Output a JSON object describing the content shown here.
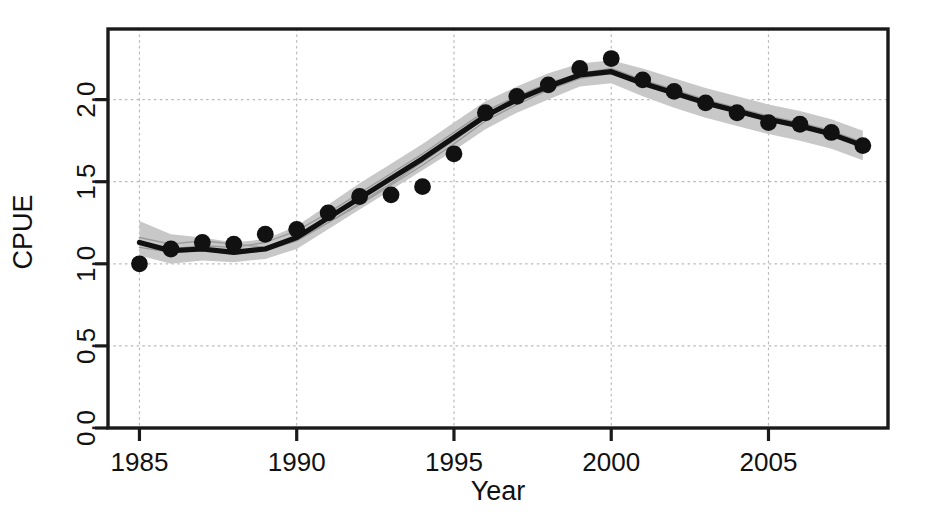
{
  "figure": {
    "background": "#ffffff",
    "frame_color": "#1a1a1a",
    "grid_color": "#b9b9b9",
    "point_color": "#111111",
    "line_color": "#111111",
    "band_color": "#c8c8c8",
    "replicate_color": "#9a9a9a"
  },
  "axes": {
    "x_title": "Year",
    "y_title": "CPUE",
    "x_ticks": [
      "1985",
      "1990",
      "1995",
      "2000",
      "2005"
    ],
    "y_ticks": [
      "0.0",
      "0.5",
      "1.0",
      "1.5",
      "2.0"
    ]
  },
  "chart_data": {
    "type": "line",
    "title": "",
    "xlabel": "Year",
    "ylabel": "CPUE",
    "xlim": [
      1984.0,
      2008.8
    ],
    "ylim": [
      0.0,
      2.43
    ],
    "grid": true,
    "legend": "none",
    "x": [
      1985,
      1986,
      1987,
      1988,
      1989,
      1990,
      1991,
      1992,
      1993,
      1994,
      1995,
      1996,
      1997,
      1998,
      1999,
      2000,
      2001,
      2002,
      2003,
      2004,
      2005,
      2006,
      2007,
      2008
    ],
    "series": [
      {
        "name": "Observed CPUE",
        "style": "points",
        "values": [
          1.0,
          1.09,
          1.13,
          1.12,
          1.18,
          1.21,
          1.31,
          1.41,
          1.42,
          1.47,
          1.67,
          1.92,
          2.02,
          2.09,
          2.19,
          2.25,
          2.12,
          2.05,
          1.98,
          1.92,
          1.86,
          1.85,
          1.8,
          1.72
        ]
      },
      {
        "name": "Fitted model",
        "style": "thick-line",
        "values": [
          1.13,
          1.08,
          1.09,
          1.07,
          1.09,
          1.16,
          1.28,
          1.4,
          1.52,
          1.64,
          1.77,
          1.9,
          2.0,
          2.08,
          2.15,
          2.17,
          2.1,
          2.04,
          1.98,
          1.93,
          1.88,
          1.84,
          1.79,
          1.72
        ]
      },
      {
        "name": "Confidence band upper",
        "style": "band-upper",
        "values": [
          1.26,
          1.18,
          1.16,
          1.13,
          1.15,
          1.23,
          1.36,
          1.49,
          1.61,
          1.73,
          1.86,
          1.99,
          2.08,
          2.16,
          2.22,
          2.24,
          2.19,
          2.13,
          2.07,
          2.02,
          1.97,
          1.93,
          1.88,
          1.81
        ]
      },
      {
        "name": "Confidence band lower",
        "style": "band-lower",
        "values": [
          1.05,
          1.0,
          1.02,
          1.01,
          1.03,
          1.09,
          1.21,
          1.33,
          1.45,
          1.57,
          1.69,
          1.82,
          1.92,
          2.0,
          2.08,
          2.1,
          2.02,
          1.95,
          1.89,
          1.84,
          1.79,
          1.75,
          1.7,
          1.63
        ]
      },
      {
        "name": "Replicate run 1",
        "style": "thin-line",
        "values": [
          1.12,
          1.09,
          1.11,
          1.1,
          1.13,
          1.2,
          1.31,
          1.43,
          1.55,
          1.67,
          1.8,
          1.93,
          2.02,
          2.1,
          2.16,
          2.19,
          2.12,
          2.06,
          2.0,
          1.95,
          1.9,
          1.86,
          1.81,
          1.74
        ]
      },
      {
        "name": "Replicate run 2",
        "style": "thin-line",
        "values": [
          1.16,
          1.12,
          1.14,
          1.12,
          1.1,
          1.15,
          1.25,
          1.37,
          1.49,
          1.62,
          1.75,
          1.89,
          1.99,
          2.07,
          2.14,
          2.17,
          2.11,
          2.05,
          1.99,
          1.94,
          1.89,
          1.85,
          1.8,
          1.73
        ]
      },
      {
        "name": "Replicate run 3",
        "style": "thin-line",
        "values": [
          1.1,
          1.07,
          1.08,
          1.06,
          1.08,
          1.14,
          1.25,
          1.36,
          1.48,
          1.6,
          1.73,
          1.87,
          1.97,
          2.06,
          2.13,
          2.16,
          2.09,
          2.03,
          1.97,
          1.92,
          1.87,
          1.83,
          1.78,
          1.71
        ]
      }
    ]
  }
}
